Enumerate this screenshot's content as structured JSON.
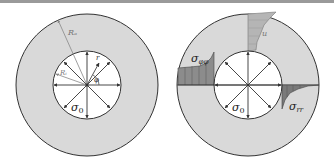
{
  "figure": {
    "left_panel": {
      "outer_radius_label": "Rₐ",
      "inner_radius_label": "Rᵢ",
      "radial_coordinate_label": "r",
      "angle_label": "φ",
      "pressure_label": "σ",
      "pressure_subscript": "0"
    },
    "right_panel": {
      "hoop_stress_label": "σ",
      "hoop_stress_subscript": "φφ",
      "radial_stress_label": "σ",
      "radial_stress_subscript": "rr",
      "displacement_label": "u",
      "pressure_label": "σ",
      "pressure_subscript": "0"
    },
    "colors": {
      "ring_fill": "#d9d9d9",
      "ring_stroke": "#333333",
      "bore_fill": "#ffffff",
      "hoop_fill": "#8c8c8c",
      "radial_fill": "#7a7a7a",
      "displacement_fill": "#b5b5b5",
      "arrow": "#333333",
      "radius_line": "#888888"
    }
  }
}
